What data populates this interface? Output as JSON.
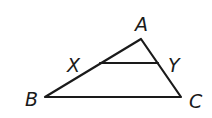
{
  "diagram": {
    "type": "triangle-with-midsegment",
    "colors": {
      "stroke": "#1a1a1a",
      "background": "#ffffff"
    },
    "points": {
      "A": {
        "x": 141,
        "y": 39
      },
      "B": {
        "x": 45,
        "y": 97
      },
      "C": {
        "x": 181,
        "y": 97
      },
      "X": {
        "x": 100,
        "y": 63
      },
      "Y": {
        "x": 158,
        "y": 63
      }
    },
    "labels": {
      "A": "A",
      "B": "B",
      "C": "C",
      "X": "X",
      "Y": "Y"
    },
    "segments": [
      {
        "from": "A",
        "to": "B"
      },
      {
        "from": "A",
        "to": "C"
      },
      {
        "from": "B",
        "to": "C"
      },
      {
        "from": "X",
        "to": "Y"
      }
    ]
  }
}
